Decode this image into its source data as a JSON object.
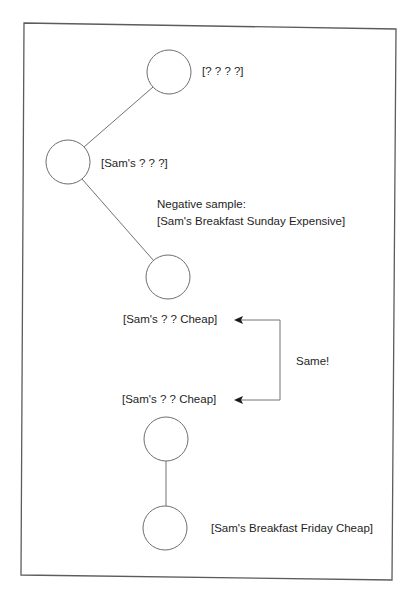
{
  "colors": {
    "background": "#ffffff",
    "stroke": "#6e6e6e",
    "text": "#1e1e1e",
    "frame": "#5c5c5c"
  },
  "nodes": [
    {
      "id": "n1",
      "label": "[? ? ? ?]"
    },
    {
      "id": "n2",
      "label": "[Sam's ? ? ?]"
    },
    {
      "id": "n3",
      "label": "[Sam's ? ? Cheap]"
    },
    {
      "id": "n4",
      "label": "[Sam's ? ? Cheap]"
    },
    {
      "id": "n5",
      "label": "[Sam's Breakfast Friday Cheap]"
    }
  ],
  "annotations": {
    "negative_sample_title": "Negative sample:",
    "negative_sample_value": "[Sam's Breakfast Sunday Expensive]",
    "same_label": "Same!"
  },
  "edges": [
    {
      "from": "n1",
      "to": "n2"
    },
    {
      "from": "n2",
      "to": "n3"
    },
    {
      "from": "n4",
      "to": "n5"
    }
  ],
  "comparison_arrow": {
    "between": [
      "n3",
      "n4"
    ],
    "label": "Same!"
  }
}
